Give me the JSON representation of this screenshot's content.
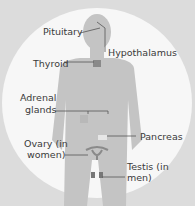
{
  "diagram": {
    "colors": {
      "background": "#dcdcdc",
      "circle": "#f7f7f7",
      "body": "#c4c4c4",
      "label_text": "#3a3a3a",
      "leader": "#555555"
    },
    "labels": {
      "pituitary": "Pituitary",
      "hypothalamus": "Hypothalamus",
      "thyroid": "Thyroid",
      "adrenal_1": "Adrenal",
      "adrenal_2": "glands",
      "pancreas": "Pancreas",
      "ovary_1": "Ovary (in",
      "ovary_2": "women)",
      "testis_1": "Testis (in",
      "testis_2": "men)"
    }
  }
}
